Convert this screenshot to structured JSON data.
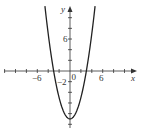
{
  "chart_data": {
    "type": "line",
    "title": "",
    "function": "y = x^2 - 9",
    "xlabel": "x",
    "ylabel": "y",
    "xlim": [
      -12,
      12
    ],
    "ylim": [
      -11,
      12
    ],
    "x_ticks_step": 2,
    "y_ticks_step": 2,
    "tick_labels": {
      "x": [
        "-6",
        "6"
      ],
      "y": [
        "6",
        "-2"
      ],
      "origin": "0"
    },
    "series": [
      {
        "name": "parabola",
        "x": [
          -4.5,
          -4,
          -3,
          -2,
          -1,
          0,
          1,
          2,
          3,
          4,
          4.5
        ],
        "values": [
          11.25,
          7,
          0,
          -5,
          -8,
          -9,
          -8,
          -5,
          0,
          7,
          11.25
        ]
      }
    ],
    "grid": false,
    "legend": null,
    "color": "#222222"
  },
  "labels": {
    "x_axis": "x",
    "y_axis": "y",
    "origin": "0",
    "x_neg6": "−6",
    "x_pos6": "6",
    "y_pos6": "6",
    "y_neg2": "−2"
  }
}
